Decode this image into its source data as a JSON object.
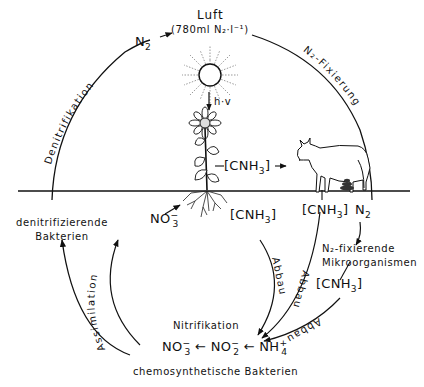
{
  "diagram": {
    "type": "nitrogen-cycle",
    "colors": {
      "ink": "#111111",
      "background": "#ffffff"
    },
    "air": {
      "title": "Luft",
      "concentration": "(780ml N₂·l⁻¹)",
      "n2_label": "N",
      "n2_sub": "2"
    },
    "sun": {
      "energy_label": "h·v"
    },
    "processes": {
      "denitrification": "Denitrifikation",
      "fixation": "N₂-Fixierung",
      "assimilation": "Assimilation",
      "decomposition": "Abbau",
      "nitrification": "Nitrifikation"
    },
    "organisms": {
      "denitrifying_bacteria_line1": "denitrifizierende",
      "denitrifying_bacteria_line2": "Bakterien",
      "n2_fixing_line1": "N₂-fixierende",
      "n2_fixing_line2": "Mikroorganismen",
      "chemosynthetic_bacteria": "chemosynthetische Bakterien"
    },
    "compounds": {
      "cnh3_base": "[CNH",
      "cnh3_sub": "3",
      "cnh3_close": "]",
      "no3_base": "NO",
      "no3_sub": "3",
      "no3_sup": "−",
      "no2_base": "NO",
      "no2_sub": "2",
      "no2_sup": "−",
      "nh4_base": "NH",
      "nh4_sub": "4",
      "nh4_sup": "+",
      "n2_base": "N",
      "n2_sub": "2",
      "arrow_left": "←"
    }
  }
}
